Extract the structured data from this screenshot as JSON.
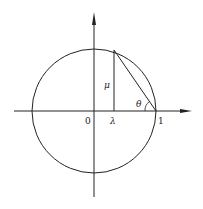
{
  "diagram": {
    "type": "unit-circle-geometry",
    "labels": {
      "origin": "0",
      "lambda": "λ",
      "mu": "μ",
      "theta": "θ",
      "one": "1"
    },
    "colors": {
      "stroke": "#222222",
      "background": "#ffffff"
    }
  }
}
